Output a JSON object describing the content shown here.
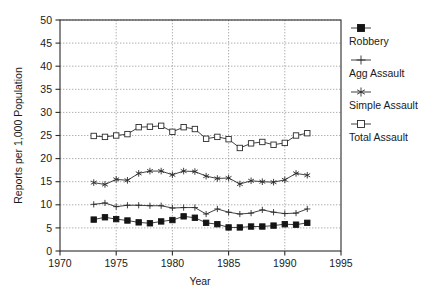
{
  "chart_data": {
    "type": "line",
    "title": "",
    "xlabel": "Year",
    "ylabel": "Reports per 1,000 Population",
    "xlim": [
      1970,
      1995
    ],
    "ylim": [
      0,
      50
    ],
    "xticks": [
      1970,
      1975,
      1980,
      1985,
      1990,
      1995
    ],
    "yticks": [
      0,
      5,
      10,
      15,
      20,
      25,
      30,
      35,
      40,
      45,
      50
    ],
    "grid": true,
    "legend_position": "right",
    "x": [
      1973,
      1974,
      1975,
      1976,
      1977,
      1978,
      1979,
      1980,
      1981,
      1982,
      1983,
      1984,
      1985,
      1986,
      1987,
      1988,
      1989,
      1990,
      1991,
      1992
    ],
    "series": [
      {
        "name": "Robbery",
        "marker": "filled-square",
        "values": [
          6.8,
          7.3,
          6.9,
          6.6,
          6.2,
          6.0,
          6.4,
          6.7,
          7.5,
          7.2,
          6.1,
          5.8,
          5.1,
          5.1,
          5.3,
          5.3,
          5.5,
          5.8,
          5.7,
          6.1
        ]
      },
      {
        "name": "Agg Assault",
        "marker": "plus",
        "values": [
          10.1,
          10.4,
          9.6,
          9.9,
          9.9,
          9.8,
          9.8,
          9.3,
          9.4,
          9.4,
          8.0,
          9.1,
          8.4,
          8.0,
          8.2,
          8.9,
          8.4,
          8.1,
          8.2,
          9.1
        ]
      },
      {
        "name": "Simple Assault",
        "marker": "asterisk",
        "values": [
          14.8,
          14.4,
          15.5,
          15.3,
          16.8,
          17.3,
          17.3,
          16.5,
          17.3,
          17.2,
          16.2,
          15.7,
          15.8,
          14.5,
          15.2,
          15.0,
          14.9,
          15.4,
          16.8,
          16.4
        ]
      },
      {
        "name": "Total Assault",
        "marker": "open-square",
        "values": [
          24.9,
          24.7,
          25.0,
          25.3,
          26.8,
          26.9,
          27.1,
          25.8,
          26.8,
          26.4,
          24.3,
          24.7,
          24.2,
          22.3,
          23.3,
          23.6,
          23.0,
          23.4,
          25.0,
          25.5
        ]
      }
    ]
  },
  "legend": {
    "items": [
      {
        "label": "Robbery",
        "marker": "filled-square"
      },
      {
        "label": "Agg Assault",
        "marker": "plus"
      },
      {
        "label": "Simple Assault",
        "marker": "asterisk"
      },
      {
        "label": "Total Assault",
        "marker": "open-square"
      }
    ]
  },
  "axes": {
    "x_title": "Year",
    "y_title": "Reports per 1,000 Population",
    "x_tick_labels": [
      "1970",
      "1975",
      "1980",
      "1985",
      "1990",
      "1995"
    ],
    "y_tick_labels": [
      "0",
      "5",
      "10",
      "15",
      "20",
      "25",
      "30",
      "35",
      "40",
      "45",
      "50"
    ]
  },
  "colors": {
    "ink": "#1a1a1a",
    "grid": "#8d8d8d",
    "frame": "#2b2b2b",
    "background": "#ffffff"
  }
}
